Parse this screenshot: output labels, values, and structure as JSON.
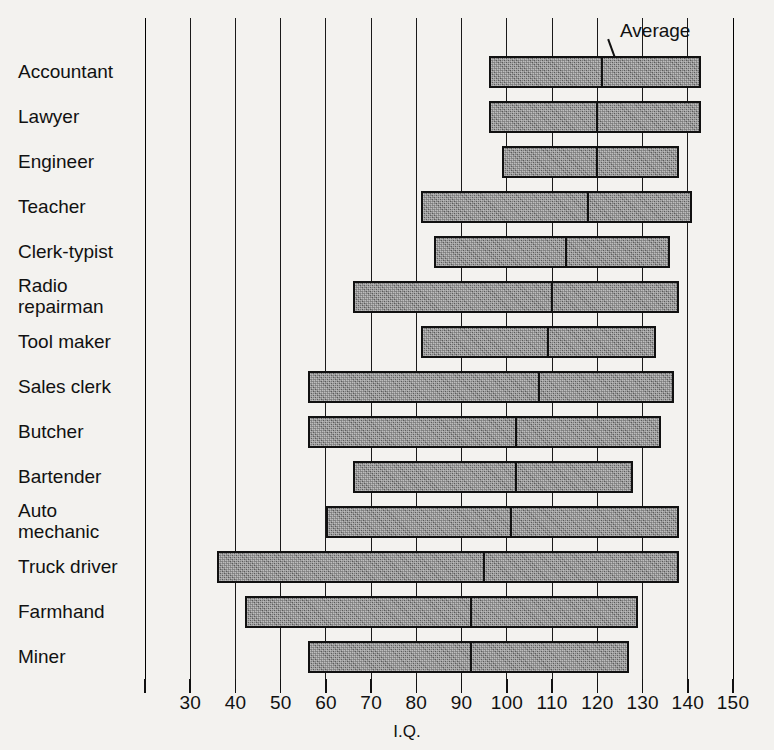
{
  "chart_data": {
    "type": "bar",
    "subtype": "range-bar-with-average-marker",
    "title": "",
    "xlabel": "I.Q.",
    "ylabel": "",
    "xlim": [
      20,
      150
    ],
    "xticks": [
      20,
      30,
      40,
      50,
      60,
      70,
      80,
      90,
      100,
      110,
      120,
      130,
      140,
      150
    ],
    "xticklabels": [
      "",
      "30",
      "40",
      "50",
      "60",
      "70",
      "80",
      "90",
      "100",
      "110",
      "120",
      "130",
      "140",
      "150"
    ],
    "grid": true,
    "grid_axis": "x",
    "legend": "none",
    "annotations": [
      {
        "text": "Average",
        "points_to": "average-marker-of-first-bar"
      }
    ],
    "categories": [
      "Accountant",
      "Lawyer",
      "Engineer",
      "Teacher",
      "Clerk-typist",
      "Radio\nrepairman",
      "Tool maker",
      "Sales clerk",
      "Butcher",
      "Bartender",
      "Auto\nmechanic",
      "Truck driver",
      "Farmhand",
      "Miner"
    ],
    "series": [
      {
        "name": "range_low",
        "values": [
          96,
          96,
          99,
          81,
          84,
          66,
          81,
          56,
          56,
          66,
          60,
          36,
          42,
          56
        ]
      },
      {
        "name": "range_high",
        "values": [
          143,
          143,
          138,
          141,
          136,
          138,
          133,
          137,
          134,
          128,
          138,
          138,
          129,
          127
        ]
      },
      {
        "name": "average",
        "values": [
          121,
          120,
          120,
          118,
          113,
          110,
          109,
          107,
          102,
          102,
          101,
          95,
          92,
          92
        ]
      }
    ]
  },
  "axis": {
    "title": "I.Q."
  },
  "annotation": {
    "average_label": "Average"
  }
}
